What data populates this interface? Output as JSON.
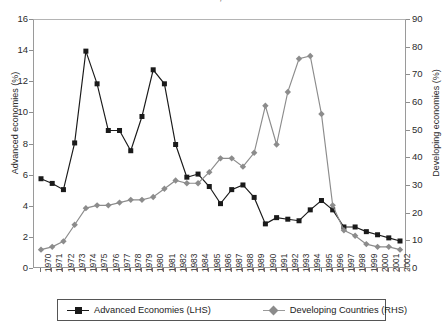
{
  "chart_data": {
    "type": "line",
    "title": "Economies, 1970-2002",
    "xlabel": "",
    "ylabel": "Advanced economies (%)",
    "y2label": "Developing economies (%)",
    "ylim": [
      0,
      16
    ],
    "y2lim": [
      0,
      90
    ],
    "grid": false,
    "legend_position": "bottom",
    "x": [
      1970,
      1971,
      1972,
      1973,
      1974,
      1975,
      1976,
      1977,
      1978,
      1979,
      1980,
      1981,
      1982,
      1983,
      1984,
      1985,
      1986,
      1987,
      1988,
      1989,
      1990,
      1991,
      1992,
      1993,
      1994,
      1995,
      1996,
      1997,
      1998,
      1999,
      2000,
      2001,
      2002
    ],
    "yticks_left": [
      0,
      2,
      4,
      6,
      8,
      10,
      12,
      14,
      16
    ],
    "yticks_right": [
      0,
      10,
      20,
      30,
      40,
      50,
      60,
      70,
      80,
      90
    ],
    "series": [
      {
        "name": "Advanced Economies (LHS)",
        "axis": "left",
        "color": "#1a1a1a",
        "marker": "square",
        "values": [
          5.8,
          5.5,
          5.1,
          8.1,
          14.0,
          11.9,
          8.9,
          8.9,
          7.6,
          9.8,
          12.8,
          11.9,
          8.0,
          5.9,
          6.1,
          5.3,
          4.2,
          5.1,
          5.4,
          4.6,
          2.9,
          3.3,
          3.2,
          3.1,
          3.8,
          4.4,
          3.8,
          2.7,
          2.7,
          2.4,
          2.2,
          2.0,
          1.8
        ]
      },
      {
        "name": "Developing Countries (RHS)",
        "axis": "right",
        "color": "#8c8c8c",
        "marker": "diamond",
        "values": [
          7,
          8,
          10,
          16,
          22,
          23,
          23,
          24,
          25,
          25,
          26,
          29,
          32,
          31,
          31,
          35,
          40,
          40,
          37,
          42,
          59,
          45,
          64,
          76,
          77,
          56,
          23,
          14,
          12,
          9,
          8,
          8,
          7
        ]
      }
    ]
  },
  "legend": {
    "items": [
      {
        "label": "Advanced Economies (LHS)",
        "marker": "square",
        "color": "#1a1a1a"
      },
      {
        "label": "Developing Countries (RHS)",
        "marker": "diamond",
        "color": "#8c8c8c"
      }
    ]
  }
}
